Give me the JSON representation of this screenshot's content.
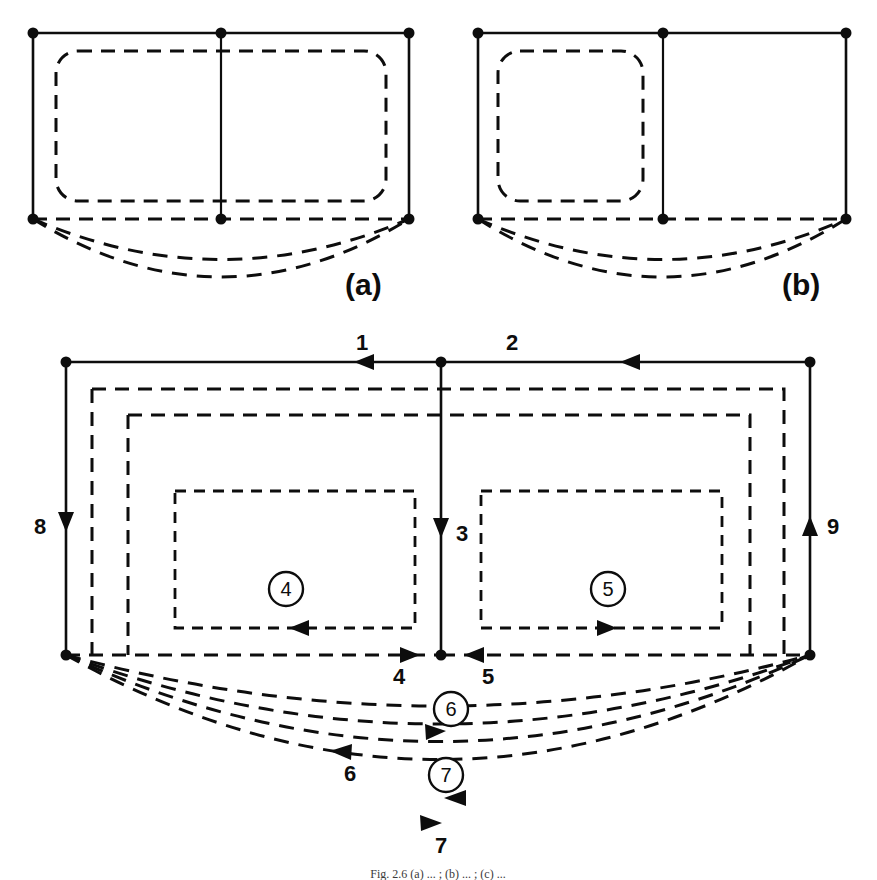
{
  "figure": {
    "caption": "Fig. 2.6   (a) ... ; (b) ... ; (c) ...",
    "panels": [
      {
        "id": "a",
        "label": "(a)"
      },
      {
        "id": "b",
        "label": "(b)"
      },
      {
        "id": "c",
        "label": ""
      }
    ]
  },
  "colors": {
    "ink": "#0d0d0d",
    "paper": "#ffffff",
    "caption": "#3a3a3a"
  },
  "panel_a": {
    "label": "(a)",
    "nodes": 6,
    "inner_loops": 1,
    "arcs": 2
  },
  "panel_b": {
    "label": "(b)",
    "nodes": 6,
    "inner_loops": 1,
    "arcs": 2
  },
  "main_panel": {
    "edge_labels": {
      "top_left": "1",
      "top_right": "2",
      "center_vertical": "3",
      "bottom_left": "4",
      "bottom_right": "5",
      "left_side": "8",
      "right_side": "9",
      "arc_upper": "6",
      "arc_lower": "7"
    },
    "circled_labels": {
      "loop_left": "4",
      "loop_right": "5",
      "arc_band_upper": "6",
      "arc_band_lower": "7"
    },
    "arrow_directions": {
      "1": "left",
      "2": "left",
      "3": "down",
      "4": "right",
      "5": "left",
      "6": "left",
      "7": "right",
      "8": "down",
      "9": "up",
      "loop_left": "left",
      "loop_right": "right"
    },
    "arc_count": 4,
    "nested_dashed_loops": 2
  }
}
